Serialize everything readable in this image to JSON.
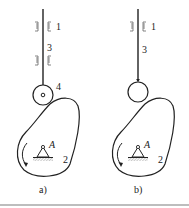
{
  "figure": {
    "panels": [
      {
        "id": "a",
        "caption": "a)",
        "follower_type": "roller",
        "labels": {
          "guide": "1",
          "rod": "3",
          "roller": "4",
          "cam": "2",
          "pivot": "A"
        }
      },
      {
        "id": "b",
        "caption": "b)",
        "follower_type": "knife-edge",
        "labels": {
          "guide": "1",
          "rod": "3",
          "cam": "2",
          "pivot": "A"
        }
      }
    ],
    "colors": {
      "line": "#222222",
      "hatch": "#888888",
      "separator": "#bdbdbd"
    }
  }
}
